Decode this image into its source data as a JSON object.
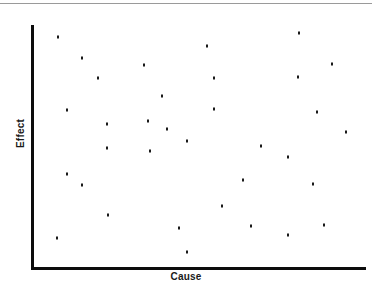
{
  "chart_data": {
    "type": "scatter",
    "title": "",
    "subtitle": "",
    "xlabel": "Cause",
    "ylabel": "Effect",
    "xlim": [
      0,
      100
    ],
    "ylim": [
      0,
      100
    ],
    "grid": false,
    "legend": null,
    "xticks": [],
    "yticks": [],
    "marker": {
      "shape": "square",
      "color": "#1a1a1a",
      "size_px": 2
    },
    "series": [
      {
        "name": "observations",
        "color": "#1a1a1a",
        "n": 34,
        "points": [
          {
            "x": 7.6,
            "y": 95.1
          },
          {
            "x": 14.8,
            "y": 86.4
          },
          {
            "x": 19.7,
            "y": 78.2
          },
          {
            "x": 33.6,
            "y": 83.5
          },
          {
            "x": 52.7,
            "y": 91.4
          },
          {
            "x": 80.6,
            "y": 96.7
          },
          {
            "x": 90.6,
            "y": 84.0
          },
          {
            "x": 80.3,
            "y": 78.6
          },
          {
            "x": 54.8,
            "y": 78.2
          },
          {
            "x": 39.1,
            "y": 70.8
          },
          {
            "x": 10.3,
            "y": 65.0
          },
          {
            "x": 54.8,
            "y": 65.4
          },
          {
            "x": 86.1,
            "y": 64.2
          },
          {
            "x": 34.8,
            "y": 60.5
          },
          {
            "x": 22.4,
            "y": 59.3
          },
          {
            "x": 40.6,
            "y": 57.2
          },
          {
            "x": 94.8,
            "y": 56.0
          },
          {
            "x": 46.7,
            "y": 52.3
          },
          {
            "x": 22.4,
            "y": 49.4
          },
          {
            "x": 35.5,
            "y": 48.1
          },
          {
            "x": 69.1,
            "y": 50.2
          },
          {
            "x": 77.3,
            "y": 45.7
          },
          {
            "x": 10.3,
            "y": 38.7
          },
          {
            "x": 14.8,
            "y": 34.2
          },
          {
            "x": 63.6,
            "y": 36.2
          },
          {
            "x": 84.8,
            "y": 34.6
          },
          {
            "x": 57.3,
            "y": 25.5
          },
          {
            "x": 22.7,
            "y": 21.8
          },
          {
            "x": 44.2,
            "y": 16.5
          },
          {
            "x": 66.1,
            "y": 17.3
          },
          {
            "x": 88.2,
            "y": 17.7
          },
          {
            "x": 77.3,
            "y": 13.6
          },
          {
            "x": 7.3,
            "y": 12.3
          },
          {
            "x": 46.7,
            "y": 6.6
          }
        ]
      }
    ]
  },
  "axes": {
    "x_label": "Cause",
    "y_label": "Effect",
    "axis_color": "#0c0c0c"
  },
  "decorations": {
    "top_rule_color": "#9a9a9a"
  }
}
